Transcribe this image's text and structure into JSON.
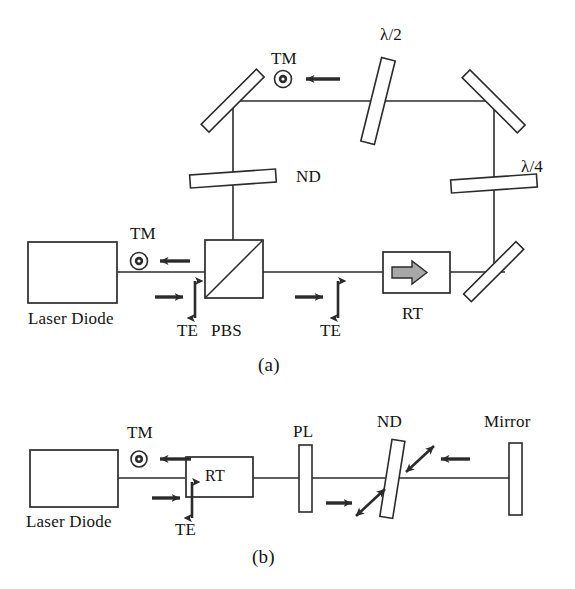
{
  "figure": {
    "panels": [
      {
        "id": "a",
        "caption": "(a)",
        "labels": {
          "laser_diode": "Laser Diode",
          "tm_near_source": "TM",
          "te_near_source": "TE",
          "pbs": "PBS",
          "te_after_pbs": "TE",
          "rt": "RT",
          "nd": "ND",
          "tm_top": "TM",
          "half_wave": "λ/2",
          "quarter_wave": "λ/4"
        },
        "icons": {
          "tm_symbol": "dot-in-circle-icon",
          "te_symbol": "double-headed-vertical-arrow-icon",
          "propagation_symbol": "right-arrow-icon",
          "reverse_propagation_symbol": "left-arrow-icon",
          "rotator_symbol": "gray-block-arrow-icon",
          "mirror_symbol": "tilted-mirror-icon",
          "waveplate_symbol": "tilted-plate-icon",
          "pbs_symbol": "beam-splitter-cube-icon"
        }
      },
      {
        "id": "b",
        "caption": "(b)",
        "labels": {
          "laser_diode": "Laser Diode",
          "tm_near_source": "TM",
          "te_near_source": "TE",
          "rt": "RT",
          "pl": "PL",
          "nd": "ND",
          "mirror": "Mirror"
        },
        "icons": {
          "tm_symbol": "dot-in-circle-icon",
          "te_symbol": "double-headed-vertical-arrow-icon",
          "propagation_symbol": "right-arrow-icon",
          "reverse_propagation_symbol": "left-arrow-icon",
          "diagonal_polarization_symbol": "double-headed-diagonal-arrow-icon",
          "polarizer_symbol": "vertical-plate-icon",
          "nd_symbol": "tilted-plate-icon",
          "mirror_symbol": "vertical-mirror-icon"
        }
      }
    ],
    "colors": {
      "stroke": "#2b2b2b",
      "text": "#141414",
      "background": "#ffffff",
      "rotator_fill": "#a8a8a8"
    }
  }
}
